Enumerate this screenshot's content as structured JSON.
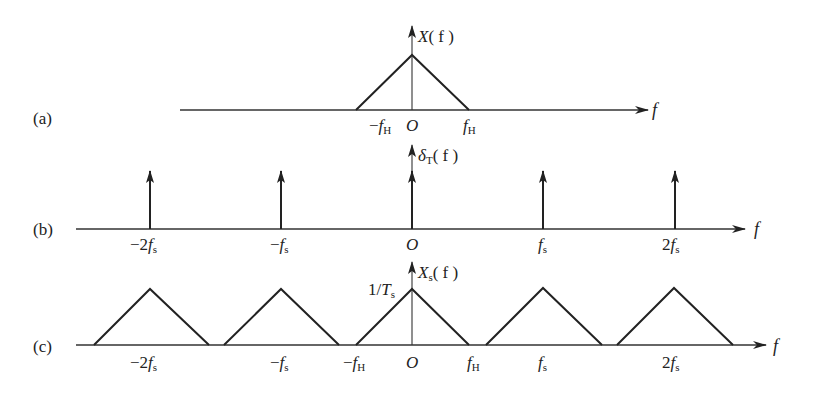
{
  "panels": [
    {
      "id": "a",
      "label": "(a)",
      "y_label_main": "X",
      "y_label_arg": "( f )",
      "x_label": "f",
      "ticks": [
        {
          "pre": "−",
          "main": "f",
          "sub": "H"
        },
        {
          "pre": "",
          "main": "O",
          "sub": ""
        },
        {
          "pre": "",
          "main": "f",
          "sub": "H"
        }
      ]
    },
    {
      "id": "b",
      "label": "(b)",
      "y_label_main": "δ",
      "y_label_sub": "T",
      "y_label_arg": "( f )",
      "x_label": "f",
      "ticks": [
        {
          "pre": "−2",
          "main": "f",
          "sub": "s"
        },
        {
          "pre": "−",
          "main": "f",
          "sub": "s"
        },
        {
          "pre": "",
          "main": "O",
          "sub": ""
        },
        {
          "pre": "",
          "main": "f",
          "sub": "s"
        },
        {
          "pre": "2",
          "main": "f",
          "sub": "s"
        }
      ]
    },
    {
      "id": "c",
      "label": "(c)",
      "y_label_main": "X",
      "y_label_sub": "s",
      "y_label_arg": "( f )",
      "peak_label_pre": "1/",
      "peak_label_main": "T",
      "peak_label_sub": "s",
      "x_label": "f",
      "ticks": [
        {
          "pre": "−2",
          "main": "f",
          "sub": "s"
        },
        {
          "pre": "−",
          "main": "f",
          "sub": "s"
        },
        {
          "pre": "−",
          "main": "f",
          "sub": "H"
        },
        {
          "pre": "",
          "main": "O",
          "sub": ""
        },
        {
          "pre": "",
          "main": "f",
          "sub": "H"
        },
        {
          "pre": "",
          "main": "f",
          "sub": "s"
        },
        {
          "pre": "2",
          "main": "f",
          "sub": "s"
        }
      ]
    }
  ]
}
